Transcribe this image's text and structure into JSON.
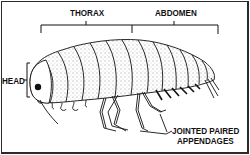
{
  "diagram": {
    "labels": {
      "thorax": "THORAX",
      "abdomen": "ABDOMEN",
      "head": "HEAD",
      "appendages_line1": "JOINTED PAIRED",
      "appendages_line2": "APPENDAGES"
    },
    "colors": {
      "ink": "#111111",
      "background": "#ffffff",
      "border": "#2a2a2a"
    }
  }
}
